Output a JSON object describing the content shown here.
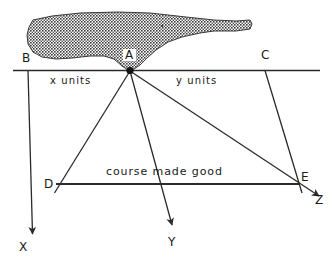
{
  "diagram": {
    "baseline_label_left": "x  units",
    "baseline_label_right": "y  units",
    "course_label": "course  made  good",
    "points": {
      "a": "A",
      "b": "B",
      "c": "C",
      "d": "D",
      "e": "E"
    },
    "axes": {
      "x": "X",
      "y": "Y",
      "z": "Z"
    },
    "colors": {
      "line": "#2b2b2b",
      "land_fill": "#6d6d6d",
      "background": "#ffffff",
      "text": "#1a1a1a"
    }
  }
}
